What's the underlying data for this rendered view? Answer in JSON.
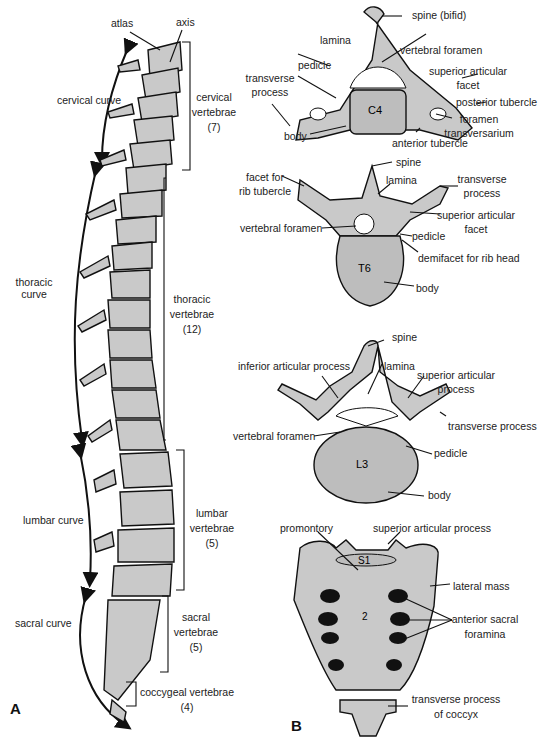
{
  "figure": {
    "panel_a_letter": "A",
    "panel_b_letter": "B",
    "fill_color": "#c9c9c9",
    "outline_color": "#111111"
  },
  "panel_a": {
    "title": "Lateral view of vertebral column",
    "top_labels": {
      "atlas": "atlas",
      "axis": "axis"
    },
    "curves": [
      {
        "name": "cervical curve",
        "lines": [
          "cervical curve"
        ]
      },
      {
        "name": "thoracic curve",
        "lines": [
          "thoracic",
          "curve"
        ]
      },
      {
        "name": "lumbar curve",
        "lines": [
          "lumbar curve"
        ]
      },
      {
        "name": "sacral curve",
        "lines": [
          "sacral curve"
        ]
      }
    ],
    "regions": [
      {
        "name": "cervical",
        "lines": [
          "cervical",
          "vertebrae",
          "(7)"
        ]
      },
      {
        "name": "thoracic",
        "lines": [
          "thoracic",
          "vertebrae",
          "(12)"
        ]
      },
      {
        "name": "lumbar",
        "lines": [
          "lumbar",
          "vertebrae",
          "(5)"
        ]
      },
      {
        "name": "sacral",
        "lines": [
          "sacral",
          "vertebrae",
          "(5)"
        ]
      },
      {
        "name": "coccygeal",
        "lines": [
          "coccygeal vertebrae",
          "(4)"
        ]
      }
    ]
  },
  "panel_b": {
    "cervical": {
      "body_tag": "C4",
      "labels": {
        "spine": "spine (bifid)",
        "lamina": "lamina",
        "vertebral_foramen": "vertebral foramen",
        "pedicle": "pedicle",
        "superior_articular_facet": [
          "superior articular",
          "facet"
        ],
        "transverse_process": [
          "transverse",
          "process"
        ],
        "posterior_tubercle": "posterior tubercle",
        "foramen_transversarium": [
          "foramen",
          "transversarium"
        ],
        "body": "body",
        "anterior_tubercle": "anterior tubercle"
      }
    },
    "thoracic": {
      "body_tag": "T6",
      "labels": {
        "spine": "spine",
        "facet_rib_tubercle": [
          "facet for",
          "rib tubercle"
        ],
        "lamina": "lamina",
        "transverse_process": [
          "transverse",
          "process"
        ],
        "superior_articular_facet": [
          "superior articular",
          "facet"
        ],
        "vertebral_foramen": "vertebral foramen",
        "pedicle": "pedicle",
        "demifacet": "demifacet for rib head",
        "body": "body"
      }
    },
    "lumbar": {
      "body_tag": "L3",
      "labels": {
        "spine": "spine",
        "inferior_articular_process": "inferior articular process",
        "lamina": "lamina",
        "superior_articular_process": [
          "superior articular",
          "process"
        ],
        "transverse_process": "transverse process",
        "vertebral_foramen": "vertebral foramen",
        "pedicle": "pedicle",
        "body": "body"
      }
    },
    "sacrum": {
      "body_tag": "S1",
      "segment_tag": "2",
      "labels": {
        "promontory": "promontory",
        "superior_articular_process": "superior articular process",
        "lateral_mass": "lateral mass",
        "anterior_sacral_foramina": [
          "anterior sacral",
          "foramina"
        ],
        "transverse_process_coccyx": [
          "transverse process",
          "of coccyx"
        ]
      }
    }
  }
}
